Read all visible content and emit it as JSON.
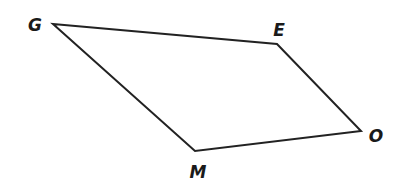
{
  "diagram": {
    "type": "quadrilateral",
    "stroke_color": "#222222",
    "vertices": [
      {
        "name": "G",
        "x": 53,
        "y": 24,
        "label_x": 35,
        "label_y": 31
      },
      {
        "name": "E",
        "x": 277,
        "y": 44,
        "label_x": 279,
        "label_y": 36
      },
      {
        "name": "O",
        "x": 361,
        "y": 131,
        "label_x": 376,
        "label_y": 142
      },
      {
        "name": "M",
        "x": 195,
        "y": 151,
        "label_x": 198,
        "label_y": 178
      }
    ],
    "labels": {
      "G": "G",
      "E": "E",
      "O": "O",
      "M": "M"
    },
    "edges": [
      [
        "G",
        "E"
      ],
      [
        "E",
        "O"
      ],
      [
        "O",
        "M"
      ],
      [
        "M",
        "G"
      ]
    ]
  }
}
